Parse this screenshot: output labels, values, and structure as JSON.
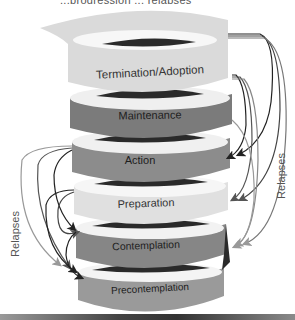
{
  "title_partial": "...progression ... relapses",
  "stages": [
    {
      "label": "Termination/Adoption",
      "fill": "#dadada",
      "text_color": "#333333",
      "cy": 70,
      "label_y": 76
    },
    {
      "label": "Maintenance",
      "fill": "#7b7b7b",
      "text_color": "#222222",
      "cy": 113,
      "label_y": 118
    },
    {
      "label": "Action",
      "fill": "#8c8c8c",
      "text_color": "#222222",
      "cy": 157,
      "label_y": 162
    },
    {
      "label": "Preparation",
      "fill": "#e0e0e0",
      "text_color": "#333333",
      "cy": 199,
      "label_y": 205
    },
    {
      "label": "Contemplation",
      "fill": "#868686",
      "text_color": "#222222",
      "cy": 242,
      "label_y": 247
    },
    {
      "label": "Precontemplation",
      "fill": "#9a9a9a",
      "text_color": "#222222",
      "cy": 286,
      "label_y": 291
    }
  ],
  "side_labels": {
    "left": "Relapses",
    "right": "Relapses"
  },
  "colors": {
    "dark_band": "#2a2a2a",
    "light_band": "#f2f2f2",
    "arrow_dark": "#222222",
    "arrow_mid": "#555555",
    "arrow_light": "#999999"
  }
}
